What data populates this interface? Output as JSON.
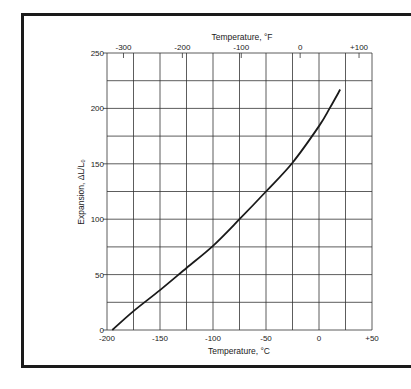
{
  "chart_data": {
    "type": "line",
    "title": "",
    "xlabel": "Temperature, °C",
    "x2label": "Temperature, °F",
    "ylabel": "Expansion, ΔL/L₀",
    "xlim": [
      -200,
      50
    ],
    "ylim": [
      0,
      250
    ],
    "grid": true,
    "x_ticks": [
      -200,
      -150,
      -100,
      -50,
      0,
      50
    ],
    "x_tick_labels": [
      "-200",
      "-150",
      "-100",
      "-50",
      "0",
      "+50"
    ],
    "x2_ticks": [
      -300,
      -200,
      -100,
      0,
      100
    ],
    "x2_tick_labels": [
      "-300",
      "-200",
      "-100",
      "0",
      "+100"
    ],
    "y_ticks": [
      0,
      50,
      100,
      150,
      200,
      250
    ],
    "y_tick_labels": [
      "0",
      "50",
      "100",
      "150",
      "200",
      "250"
    ],
    "series": [
      {
        "name": "Expansion",
        "x": [
          -195,
          -175,
          -150,
          -125,
          -100,
          -75,
          -50,
          -25,
          0,
          10,
          20
        ],
        "y": [
          0,
          17,
          36,
          56,
          76,
          100,
          125,
          151,
          184,
          200,
          217
        ]
      }
    ],
    "legend": null
  },
  "colors": {
    "frame": "#1a1a1a",
    "grid": "#333333",
    "curve": "#1a1a1a",
    "text": "#222222"
  }
}
